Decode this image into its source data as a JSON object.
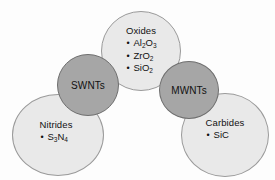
{
  "diagram": {
    "type": "venn-overlap-circles",
    "background_color": "#fdfdfd",
    "light_fill_color": "#e9e9e9",
    "dark_fill_color": "#a6a6a6",
    "nodes": [
      {
        "id": "oxides",
        "title": "Oxides",
        "style": "light",
        "items": [
          {
            "bullet": "•",
            "text": "Al2O3",
            "parts": [
              {
                "t": "Al"
              },
              {
                "s": "2"
              },
              {
                "t": "O"
              },
              {
                "s": "3"
              }
            ]
          },
          {
            "bullet": "•",
            "text": "ZrO2",
            "parts": [
              {
                "t": "ZrO"
              },
              {
                "s": "2"
              }
            ]
          },
          {
            "bullet": "•",
            "text": "SiO2",
            "parts": [
              {
                "t": "SiO"
              },
              {
                "s": "2"
              }
            ]
          }
        ]
      },
      {
        "id": "nitrides",
        "title": "Nitrides",
        "style": "light",
        "items": [
          {
            "bullet": "•",
            "text": "S3N4",
            "parts": [
              {
                "t": "S"
              },
              {
                "s": "3"
              },
              {
                "t": "N"
              },
              {
                "s": "4"
              }
            ]
          }
        ]
      },
      {
        "id": "carbides",
        "title": "Carbides",
        "style": "light",
        "items": [
          {
            "bullet": "•",
            "text": "SiC",
            "parts": [
              {
                "t": "SiC"
              }
            ]
          }
        ]
      },
      {
        "id": "swnts",
        "title": "SWNTs",
        "style": "dark",
        "items": []
      },
      {
        "id": "mwnts",
        "title": "MWNTs",
        "style": "dark",
        "items": []
      }
    ]
  }
}
